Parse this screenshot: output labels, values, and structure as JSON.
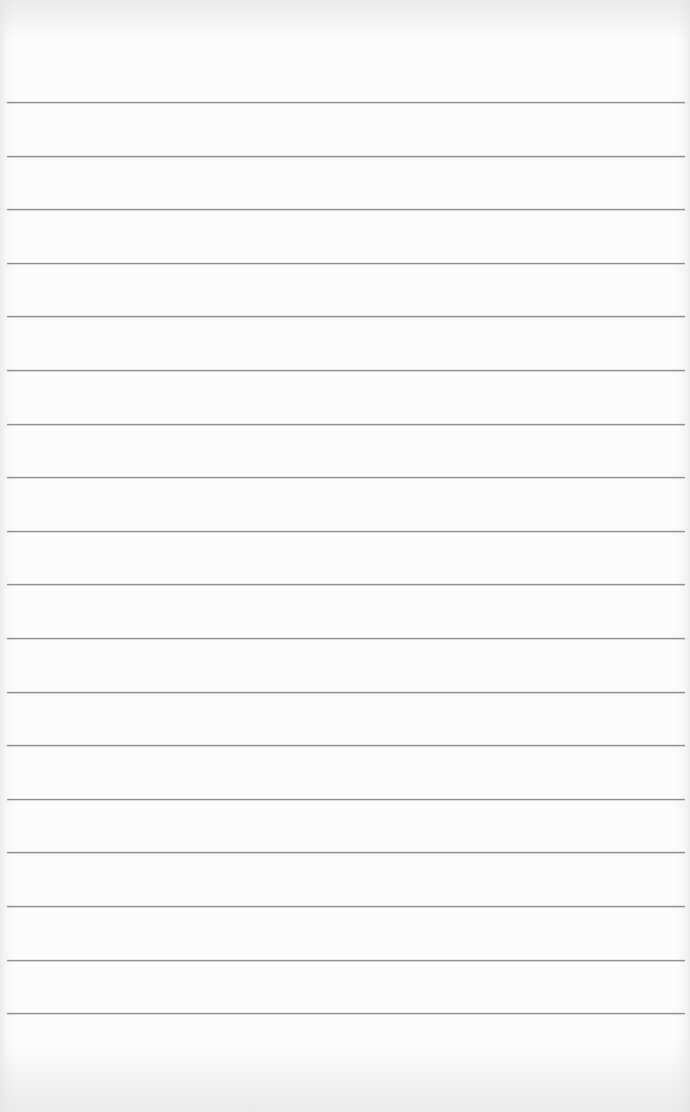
{
  "page": {
    "type": "lined-paper",
    "background_color": "#fcfcfc",
    "line_color": "#8f8f8f",
    "line_count": 18,
    "first_line_y": 102,
    "line_spacing": 53.6,
    "line_left": 7,
    "line_right": 685,
    "text": []
  }
}
